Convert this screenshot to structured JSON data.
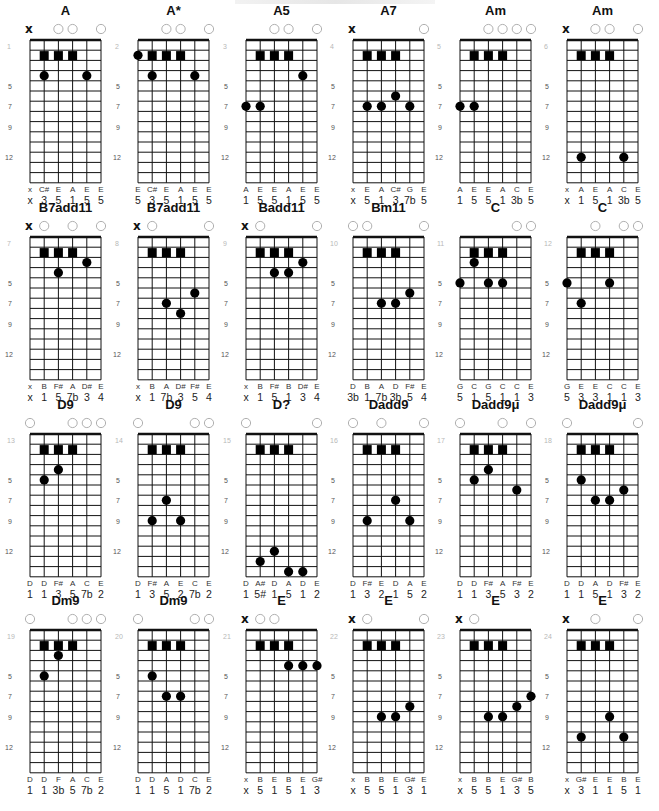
{
  "page": {
    "title_fragment": "",
    "strings": 6,
    "fret_rows": 14,
    "fret_markers": [
      {
        "label": "5",
        "row": 5
      },
      {
        "label": "7",
        "row": 7
      },
      {
        "label": "9",
        "row": 9
      },
      {
        "label": "12",
        "row": 12
      }
    ],
    "colors": {
      "line": "#111111",
      "dot": "#000000",
      "open_circle": "#b0b0b0",
      "position_number": "#b8b8b8",
      "marker_number": "#555555",
      "note_text": "#333333",
      "degree_text": "#222222"
    }
  },
  "chords": [
    {
      "name": "A",
      "position": "1",
      "header": [
        "x",
        "",
        "o",
        "o",
        "",
        "o"
      ],
      "squares": [
        1,
        2,
        3
      ],
      "dots": [
        [
          1,
          4
        ],
        [
          4,
          4
        ]
      ],
      "notes": [
        "x",
        "C#",
        "E",
        "A",
        "E",
        "E"
      ],
      "degrees": [
        "x",
        "3",
        "5",
        "1",
        "5",
        "5"
      ]
    },
    {
      "name": "A*",
      "position": "2",
      "header": [
        "",
        "",
        "o",
        "o",
        "",
        "o"
      ],
      "squares": [
        1,
        2,
        3
      ],
      "dots": [
        [
          0,
          2
        ],
        [
          1,
          4
        ],
        [
          4,
          4
        ]
      ],
      "notes": [
        "E",
        "C#",
        "E",
        "A",
        "E",
        "E"
      ],
      "degrees": [
        "5",
        "3",
        "5",
        "1",
        "5",
        "5"
      ]
    },
    {
      "name": "A5",
      "position": "3",
      "header": [
        "",
        "",
        "o",
        "o",
        "",
        "o"
      ],
      "squares": [
        1,
        2,
        3
      ],
      "dots": [
        [
          4,
          4
        ],
        [
          0,
          7
        ],
        [
          1,
          7
        ]
      ],
      "notes": [
        "A",
        "E",
        "E",
        "A",
        "E",
        "E"
      ],
      "degrees": [
        "1",
        "5",
        "5",
        "1",
        "5",
        "5"
      ]
    },
    {
      "name": "A7",
      "position": "4",
      "header": [
        "x",
        "",
        "",
        "",
        "",
        "o"
      ],
      "squares": [
        1,
        2,
        3
      ],
      "dots": [
        [
          3,
          6
        ],
        [
          1,
          7
        ],
        [
          2,
          7
        ],
        [
          4,
          7
        ]
      ],
      "notes": [
        "x",
        "E",
        "A",
        "C#",
        "G",
        "E"
      ],
      "degrees": [
        "x",
        "5",
        "1",
        "3",
        "7b",
        "5"
      ]
    },
    {
      "name": "Am",
      "position": "5",
      "header": [
        "",
        "",
        "o",
        "o",
        "o",
        "o"
      ],
      "squares": [
        1,
        2,
        3
      ],
      "dots": [
        [
          0,
          7
        ],
        [
          1,
          7
        ]
      ],
      "notes": [
        "A",
        "E",
        "E",
        "A",
        "C",
        "E"
      ],
      "degrees": [
        "1",
        "5",
        "5",
        "1",
        "3b",
        "5"
      ]
    },
    {
      "name": "Am",
      "position": "6",
      "header": [
        "x",
        "",
        "o",
        "o",
        "",
        "o"
      ],
      "squares": [
        1,
        2,
        3
      ],
      "dots": [
        [
          1,
          12
        ],
        [
          4,
          12
        ]
      ],
      "notes": [
        "x",
        "A",
        "E",
        "A",
        "C",
        "E"
      ],
      "degrees": [
        "x",
        "1",
        "5",
        "1",
        "3b",
        "5"
      ]
    },
    {
      "name": "B7add11",
      "position": "7",
      "header": [
        "x",
        "o",
        "",
        "o",
        "",
        "o"
      ],
      "squares": [
        1,
        2,
        3
      ],
      "dots": [
        [
          4,
          3
        ],
        [
          2,
          4
        ]
      ],
      "notes": [
        "x",
        "B",
        "F#",
        "A",
        "D#",
        "E"
      ],
      "degrees": [
        "x",
        "1",
        "5",
        "7b",
        "3",
        "4"
      ]
    },
    {
      "name": "B7add11",
      "position": "8",
      "header": [
        "x",
        "o",
        "",
        "",
        "",
        "o"
      ],
      "squares": [
        1,
        2,
        3
      ],
      "dots": [
        [
          4,
          6
        ],
        [
          2,
          7
        ],
        [
          3,
          8
        ]
      ],
      "notes": [
        "x",
        "B",
        "A",
        "D#",
        "F#",
        "E"
      ],
      "degrees": [
        "x",
        "1",
        "7b",
        "3",
        "5",
        "4"
      ]
    },
    {
      "name": "Badd11",
      "position": "9",
      "header": [
        "x",
        "o",
        "",
        "",
        "",
        "o"
      ],
      "squares": [
        1,
        2,
        3
      ],
      "dots": [
        [
          4,
          3
        ],
        [
          2,
          4
        ],
        [
          3,
          4
        ]
      ],
      "notes": [
        "x",
        "B",
        "F#",
        "B",
        "D#",
        "E"
      ],
      "degrees": [
        "x",
        "1",
        "5",
        "1",
        "3",
        "4"
      ]
    },
    {
      "name": "Bm11",
      "position": "10",
      "header": [
        "o",
        "o",
        "",
        "",
        "",
        "o"
      ],
      "squares": [
        1,
        2,
        3
      ],
      "dots": [
        [
          4,
          6
        ],
        [
          2,
          7
        ],
        [
          3,
          7
        ]
      ],
      "notes": [
        "D",
        "B",
        "A",
        "D",
        "F#",
        "E"
      ],
      "degrees": [
        "3b",
        "1",
        "7b",
        "3b",
        "5",
        "4"
      ]
    },
    {
      "name": "C",
      "position": "11",
      "header": [
        "",
        "",
        "",
        "",
        "o",
        "o"
      ],
      "squares": [
        1,
        2,
        3
      ],
      "dots": [
        [
          1,
          3
        ],
        [
          0,
          5
        ],
        [
          2,
          5
        ],
        [
          3,
          5
        ]
      ],
      "notes": [
        "G",
        "C",
        "G",
        "C",
        "C",
        "E"
      ],
      "degrees": [
        "5",
        "1",
        "5",
        "1",
        "1",
        "3"
      ]
    },
    {
      "name": "C",
      "position": "12",
      "header": [
        "",
        "",
        "o",
        "",
        "o",
        "o"
      ],
      "squares": [
        1,
        2,
        3
      ],
      "dots": [
        [
          0,
          5
        ],
        [
          3,
          5
        ],
        [
          1,
          7
        ]
      ],
      "notes": [
        "G",
        "E",
        "E",
        "C",
        "C",
        "E"
      ],
      "degrees": [
        "5",
        "3",
        "3",
        "1",
        "1",
        "3"
      ]
    },
    {
      "name": "D9",
      "position": "13",
      "header": [
        "o",
        "",
        "",
        "o",
        "o",
        "o"
      ],
      "squares": [
        1,
        2,
        3
      ],
      "dots": [
        [
          2,
          4
        ],
        [
          1,
          5
        ]
      ],
      "notes": [
        "D",
        "D",
        "F#",
        "A",
        "C",
        "E"
      ],
      "degrees": [
        "1",
        "1",
        "3",
        "5",
        "7b",
        "2"
      ]
    },
    {
      "name": "D9",
      "position": "14",
      "header": [
        "o",
        "",
        "",
        "",
        "o",
        "o"
      ],
      "squares": [
        1,
        2,
        3
      ],
      "dots": [
        [
          2,
          7
        ],
        [
          1,
          9
        ],
        [
          3,
          9
        ]
      ],
      "notes": [
        "D",
        "F#",
        "A",
        "E",
        "C",
        "E"
      ],
      "degrees": [
        "1",
        "3",
        "5",
        "2",
        "7b",
        "2"
      ]
    },
    {
      "name": "D?",
      "position": "15",
      "header": [
        "o",
        "",
        "",
        "",
        "",
        "o"
      ],
      "squares": [
        1,
        2,
        3
      ],
      "dots": [
        [
          2,
          12
        ],
        [
          1,
          13
        ],
        [
          3,
          14
        ],
        [
          4,
          14
        ]
      ],
      "notes": [
        "D",
        "A#",
        "D",
        "A",
        "D",
        "E"
      ],
      "degrees": [
        "1",
        "5#",
        "1",
        "5",
        "1",
        "2"
      ]
    },
    {
      "name": "Dadd9",
      "position": "16",
      "header": [
        "o",
        "",
        "o",
        "",
        "",
        "o"
      ],
      "squares": [
        1,
        2,
        3
      ],
      "dots": [
        [
          3,
          7
        ],
        [
          1,
          9
        ],
        [
          4,
          9
        ]
      ],
      "notes": [
        "D",
        "F#",
        "E",
        "D",
        "A",
        "E"
      ],
      "degrees": [
        "1",
        "3",
        "2",
        "1",
        "5",
        "2"
      ]
    },
    {
      "name": "Dadd9μ",
      "position": "17",
      "header": [
        "o",
        "",
        "",
        "o",
        "",
        "o"
      ],
      "squares": [
        1,
        2,
        3
      ],
      "dots": [
        [
          2,
          4
        ],
        [
          1,
          5
        ],
        [
          4,
          6
        ]
      ],
      "notes": [
        "D",
        "D",
        "F#",
        "A",
        "F#",
        "E"
      ],
      "degrees": [
        "1",
        "1",
        "3",
        "5",
        "3",
        "2"
      ]
    },
    {
      "name": "Dadd9μ",
      "position": "18",
      "header": [
        "o",
        "",
        "",
        "",
        "",
        "o"
      ],
      "squares": [
        1,
        2,
        3
      ],
      "dots": [
        [
          1,
          5
        ],
        [
          4,
          6
        ],
        [
          2,
          7
        ],
        [
          3,
          7
        ]
      ],
      "notes": [
        "D",
        "D",
        "A",
        "D",
        "F#",
        "E"
      ],
      "degrees": [
        "1",
        "1",
        "5",
        "1",
        "3",
        "2"
      ]
    },
    {
      "name": "Dm9",
      "position": "19",
      "header": [
        "o",
        "",
        "",
        "o",
        "o",
        "o"
      ],
      "squares": [
        1,
        2,
        3
      ],
      "dots": [
        [
          2,
          3
        ],
        [
          1,
          5
        ]
      ],
      "notes": [
        "D",
        "D",
        "F",
        "A",
        "C",
        "E"
      ],
      "degrees": [
        "1",
        "1",
        "3b",
        "5",
        "7b",
        "2"
      ]
    },
    {
      "name": "Dm9",
      "position": "20",
      "header": [
        "o",
        "",
        "",
        "",
        "o",
        "o"
      ],
      "squares": [
        1,
        2,
        3
      ],
      "dots": [
        [
          1,
          5
        ],
        [
          2,
          7
        ],
        [
          3,
          7
        ]
      ],
      "notes": [
        "D",
        "D",
        "A",
        "D",
        "C",
        "E"
      ],
      "degrees": [
        "1",
        "1",
        "5",
        "1",
        "7b",
        "2"
      ]
    },
    {
      "name": "E",
      "position": "21",
      "header": [
        "x",
        "o",
        "o",
        "",
        "",
        ""
      ],
      "squares": [
        1,
        2,
        3
      ],
      "dots": [
        [
          3,
          4
        ],
        [
          4,
          4
        ],
        [
          5,
          4
        ]
      ],
      "notes": [
        "x",
        "B",
        "E",
        "B",
        "E",
        "G#"
      ],
      "degrees": [
        "x",
        "5",
        "1",
        "5",
        "1",
        "3"
      ]
    },
    {
      "name": "E",
      "position": "22",
      "header": [
        "x",
        "o",
        "",
        "",
        "",
        "o"
      ],
      "squares": [
        1,
        2,
        3
      ],
      "dots": [
        [
          4,
          8
        ],
        [
          2,
          9
        ],
        [
          3,
          9
        ]
      ],
      "notes": [
        "x",
        "B",
        "B",
        "E",
        "G#",
        "E"
      ],
      "degrees": [
        "x",
        "5",
        "5",
        "1",
        "3",
        "1"
      ]
    },
    {
      "name": "E",
      "position": "23",
      "header": [
        "x",
        "o",
        "",
        "",
        "",
        ""
      ],
      "squares": [
        1,
        2,
        3
      ],
      "dots": [
        [
          5,
          7
        ],
        [
          4,
          8
        ],
        [
          2,
          9
        ],
        [
          3,
          9
        ]
      ],
      "notes": [
        "x",
        "B",
        "B",
        "E",
        "G#",
        "B"
      ],
      "degrees": [
        "x",
        "5",
        "5",
        "1",
        "3",
        "5"
      ]
    },
    {
      "name": "E",
      "position": "24",
      "header": [
        "x",
        "",
        "o",
        "",
        "",
        "o"
      ],
      "squares": [
        1,
        2,
        3
      ],
      "dots": [
        [
          3,
          9
        ],
        [
          1,
          11
        ],
        [
          4,
          11
        ]
      ],
      "notes": [
        "x",
        "G#",
        "E",
        "E",
        "B",
        "E"
      ],
      "degrees": [
        "x",
        "3",
        "1",
        "1",
        "5",
        "1"
      ]
    }
  ]
}
